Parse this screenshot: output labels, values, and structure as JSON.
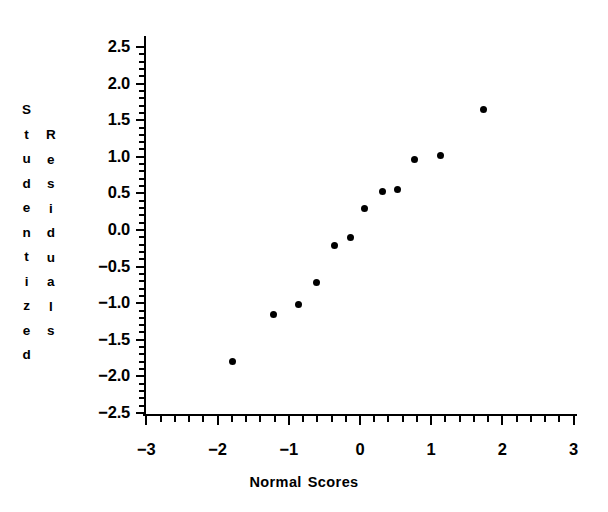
{
  "chart_data": {
    "type": "scatter",
    "title": "",
    "xlabel": "Normal Scores",
    "ylabel": "Studentized Residuals",
    "ylabel_columns": [
      "Studentized",
      "Residuals"
    ],
    "xlim": [
      -3.5,
      3.5
    ],
    "ylim": [
      -2.5,
      2.5
    ],
    "xticks": [
      -3,
      -2,
      -1,
      0,
      1,
      2,
      3
    ],
    "xtick_labels": [
      "−3",
      "−2",
      "−1",
      "0",
      "1",
      "2",
      "3"
    ],
    "yticks": [
      -2.5,
      -2.0,
      -1.5,
      -1.0,
      -0.5,
      0.0,
      0.5,
      1.0,
      1.5,
      2.0,
      2.5
    ],
    "ytick_labels": [
      "−2.5",
      "−2.0",
      "−1.5",
      "−1.0",
      "−0.5",
      "0.0",
      "0.5",
      "1.0",
      "1.5",
      "2.0",
      "2.5"
    ],
    "xminor_step": 0.2,
    "yminor_step": 0.1,
    "grid": false,
    "legend": null,
    "marker": "filled-circle",
    "marker_color": "#000000",
    "points": [
      {
        "x": -1.79,
        "y": -1.8
      },
      {
        "x": -1.21,
        "y": -1.15
      },
      {
        "x": -0.87,
        "y": -1.02
      },
      {
        "x": -0.61,
        "y": -0.72
      },
      {
        "x": -0.36,
        "y": -0.21
      },
      {
        "x": -0.14,
        "y": -0.1
      },
      {
        "x": 0.07,
        "y": 0.29
      },
      {
        "x": 0.31,
        "y": 0.53
      },
      {
        "x": 0.52,
        "y": 0.56
      },
      {
        "x": 0.77,
        "y": 0.96
      },
      {
        "x": 1.13,
        "y": 1.02
      },
      {
        "x": 1.73,
        "y": 1.65
      }
    ]
  }
}
